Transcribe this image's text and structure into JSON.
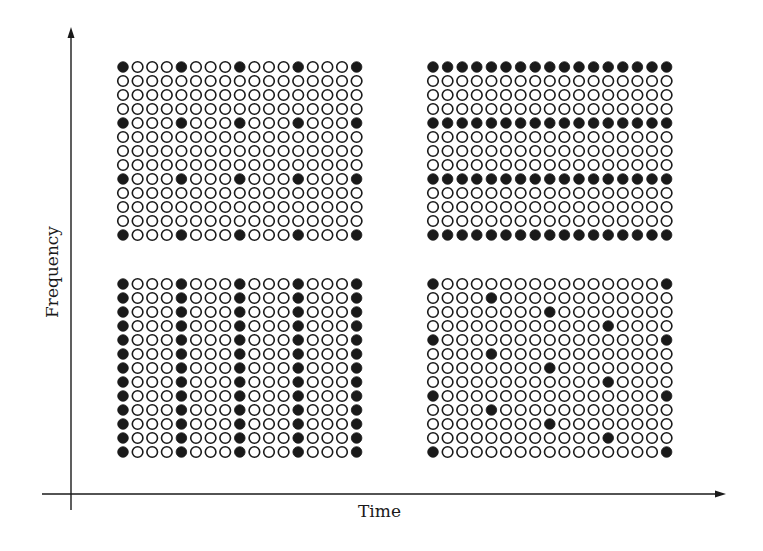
{
  "diagram": {
    "x_axis_label": "Time",
    "y_axis_label": "Frequency",
    "colors": {
      "ink": "#1a1a1a",
      "empty_fill": "#ffffff",
      "background": "#ffffff"
    },
    "grid": {
      "cols": 17,
      "rows": 13,
      "col_pitch": 14.6,
      "row_pitch": 14,
      "dot_radius": 5.3
    },
    "panels": [
      {
        "id": "top-left",
        "description": "Scattered pilots: filled where column and row are multiples of 4",
        "origin": [
          123,
          67
        ],
        "pattern": "lattice",
        "filled_cols": [
          0,
          4,
          8,
          12,
          16
        ],
        "filled_rows": [
          0,
          4,
          8,
          12
        ]
      },
      {
        "id": "top-right",
        "description": "Comb-type pilots in time: entire rows filled",
        "origin": [
          433,
          67
        ],
        "pattern": "rows",
        "filled_rows": [
          0,
          4,
          8,
          12
        ]
      },
      {
        "id": "bottom-left",
        "description": "Block-type pilots: entire columns filled",
        "origin": [
          123,
          284
        ],
        "pattern": "cols",
        "filled_cols": [
          0,
          4,
          8,
          12,
          16
        ]
      },
      {
        "id": "bottom-right",
        "description": "Diagonal/staggered pilots",
        "origin": [
          433,
          284
        ],
        "pattern": "explicit",
        "filled_cells": [
          [
            0,
            0
          ],
          [
            0,
            16
          ],
          [
            1,
            4
          ],
          [
            2,
            8
          ],
          [
            3,
            12
          ],
          [
            4,
            0
          ],
          [
            4,
            16
          ],
          [
            5,
            4
          ],
          [
            6,
            8
          ],
          [
            7,
            12
          ],
          [
            8,
            0
          ],
          [
            8,
            16
          ],
          [
            9,
            4
          ],
          [
            10,
            8
          ],
          [
            11,
            12
          ],
          [
            12,
            0
          ],
          [
            12,
            16
          ]
        ]
      }
    ]
  }
}
